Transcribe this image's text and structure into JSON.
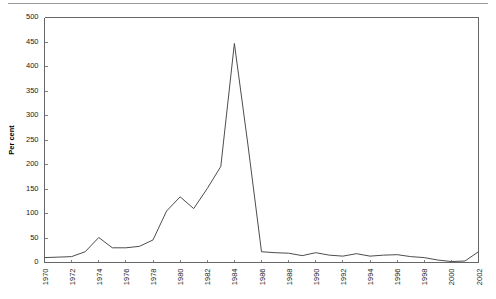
{
  "chart_data": {
    "type": "line",
    "title": "",
    "subtitle": "",
    "xlabel": "",
    "ylabel": "Per cent",
    "xlim": [
      1970,
      2002
    ],
    "ylim": [
      0,
      500
    ],
    "grid": false,
    "legend": null,
    "line_color": "#4d4d4d",
    "axis_color": "#666666",
    "ytick_labels": [
      "0",
      "50",
      "100",
      "150",
      "200",
      "250",
      "300",
      "350",
      "400",
      "450",
      "500"
    ],
    "ytick_values": [
      0,
      50,
      100,
      150,
      200,
      250,
      300,
      350,
      400,
      450,
      500
    ],
    "xtick_labels": [
      "1970",
      "1972",
      "1974",
      "1976",
      "1978",
      "1980",
      "1982",
      "1984",
      "1986",
      "1988",
      "1990",
      "1992",
      "1994",
      "1996",
      "1998",
      "2000",
      "2002"
    ],
    "xtick_values": [
      1970,
      1972,
      1974,
      1976,
      1978,
      1980,
      1982,
      1984,
      1986,
      1988,
      1990,
      1992,
      1994,
      1996,
      1998,
      2000,
      2002
    ],
    "x": [
      1970,
      1971,
      1972,
      1973,
      1974,
      1975,
      1976,
      1977,
      1978,
      1979,
      1980,
      1981,
      1982,
      1983,
      1984,
      1985,
      1986,
      1987,
      1988,
      1989,
      1990,
      1991,
      1992,
      1993,
      1994,
      1995,
      1996,
      1997,
      1998,
      1999,
      2000,
      2001,
      2002
    ],
    "values": [
      10,
      11,
      12,
      22,
      51,
      30,
      30,
      33,
      46,
      105,
      134,
      110,
      151,
      196,
      447,
      240,
      22,
      20,
      19,
      14,
      20,
      15,
      13,
      18,
      13,
      15,
      16,
      12,
      10,
      5,
      2,
      3,
      22
    ],
    "series": [
      {
        "name": "Per cent",
        "values": [
          10,
          11,
          12,
          22,
          51,
          30,
          30,
          33,
          46,
          105,
          134,
          110,
          151,
          196,
          447,
          240,
          22,
          20,
          19,
          14,
          20,
          15,
          13,
          18,
          13,
          15,
          16,
          12,
          10,
          5,
          2,
          3,
          22
        ]
      }
    ],
    "annotations": []
  }
}
